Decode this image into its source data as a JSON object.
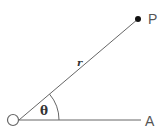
{
  "diagram": {
    "labels": {
      "origin": "O",
      "point": "P",
      "axis_end": "A",
      "radius": "r",
      "angle": "θ"
    },
    "colors": {
      "line": "#555555",
      "point": "#111111",
      "text": "#555555"
    }
  }
}
